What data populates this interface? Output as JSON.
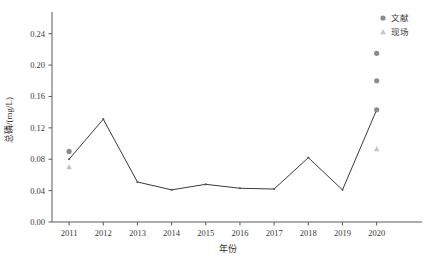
{
  "chart_data": {
    "type": "line",
    "title": "",
    "xlabel": "年份",
    "ylabel": "总磷/(mg/L)",
    "xlim": [
      2010.5,
      2020.8
    ],
    "ylim": [
      0.0,
      0.26
    ],
    "ytick_labels": [
      "0.00",
      "0.04",
      "0.08",
      "0.12",
      "0.16",
      "0.20",
      "0.24"
    ],
    "ytick_values": [
      0.0,
      0.04,
      0.08,
      0.12,
      0.16,
      0.2,
      0.24
    ],
    "xtick_labels": [
      "2011",
      "2012",
      "2013",
      "2014",
      "2015",
      "2016",
      "2017",
      "2018",
      "2019",
      "2020"
    ],
    "xtick_values": [
      2011,
      2012,
      2013,
      2014,
      2015,
      2016,
      2017,
      2018,
      2019,
      2020
    ],
    "grid": false,
    "legend_position": "top-right",
    "series": [
      {
        "name": "trend-line",
        "marker": "none",
        "color": "#3a3a3a",
        "x": [
          2011,
          2012,
          2013,
          2014,
          2015,
          2016,
          2017,
          2018,
          2019,
          2020
        ],
        "values": [
          0.08,
          0.131,
          0.051,
          0.041,
          0.048,
          0.043,
          0.042,
          0.082,
          0.041,
          0.143
        ]
      },
      {
        "name": "文献",
        "marker": "circle",
        "color": "#8c8c8c",
        "x": [
          2011,
          2020,
          2020,
          2020
        ],
        "values": [
          0.09,
          0.215,
          0.18,
          0.143
        ]
      },
      {
        "name": "现场",
        "marker": "triangle",
        "color": "#c4c4c4",
        "x": [
          2011,
          2020
        ],
        "values": [
          0.07,
          0.093
        ]
      }
    ],
    "legend": [
      {
        "label": "文献",
        "marker": "circle",
        "color": "#8c8c8c"
      },
      {
        "label": "现场",
        "marker": "triangle",
        "color": "#c4c4c4"
      }
    ]
  }
}
